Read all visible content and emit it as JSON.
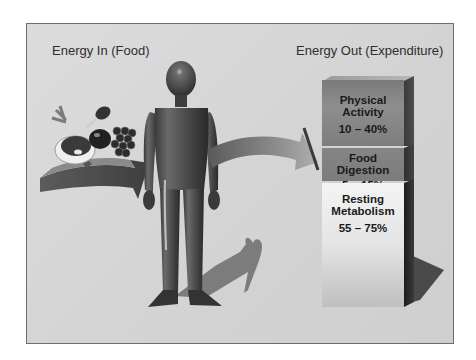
{
  "diagram": {
    "left_label": "Energy In (Food)",
    "right_label": "Energy Out (Expenditure)",
    "food_items": [
      "steak-icon",
      "carrot-icon",
      "chicken-leg-icon",
      "tomato-icon",
      "grapes-icon"
    ],
    "center_figure": "human-figure",
    "expenditure_blocks": [
      {
        "name": "Physical Activity",
        "line1": "Physical",
        "line2": "Activity",
        "range": "10 – 40%"
      },
      {
        "name": "Food Digestion",
        "line1": "Food Digestion",
        "range": "5 – 15%"
      },
      {
        "name": "Resting Metabolism",
        "line1": "Resting",
        "line2": "Metabolism",
        "range": "55 – 75%"
      }
    ],
    "colors": {
      "background": "#d6d6d6",
      "frame_border": "#6e6e6e",
      "figure": "#4a4a4a",
      "arrow": "#6a6a6a",
      "block_dark": "#808080",
      "block_light": "#eeeeee"
    }
  }
}
